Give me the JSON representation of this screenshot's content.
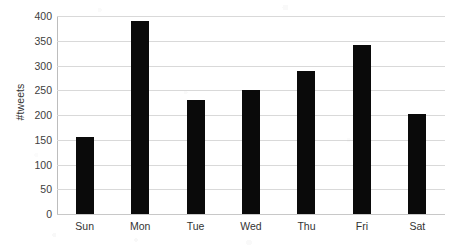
{
  "chart_data": {
    "type": "bar",
    "title": "",
    "xlabel": "",
    "ylabel": "#tweets",
    "categories": [
      "Sun",
      "Mon",
      "Tue",
      "Wed",
      "Thu",
      "Fri",
      "Sat"
    ],
    "values": [
      155,
      390,
      230,
      250,
      288,
      341,
      203
    ],
    "ylim": [
      0,
      400
    ],
    "yticks": [
      0,
      50,
      100,
      150,
      200,
      250,
      300,
      350,
      400
    ],
    "ytick_labels": [
      "0",
      "50",
      "100",
      "150",
      "200",
      "250",
      "300",
      "350",
      "400"
    ],
    "grid": "horizontal",
    "legend": "none",
    "bar_color": "#0a0a0a",
    "gridline_color": "#d9d9d9",
    "axis_text_color": "#333333",
    "background_color": "#ffffff"
  }
}
